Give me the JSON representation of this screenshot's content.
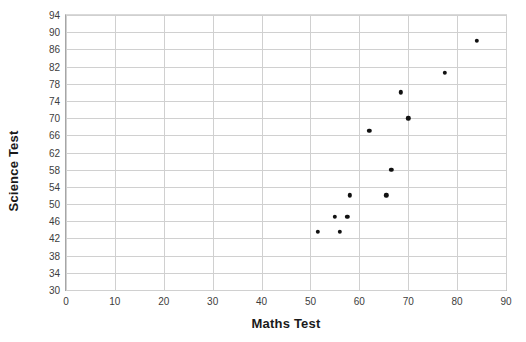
{
  "chart": {
    "title": "",
    "xlabel": "Maths Test",
    "ylabel": "Science Test"
  },
  "chart_data": {
    "type": "scatter",
    "title": "",
    "xlabel": "Maths Test",
    "ylabel": "Science Test",
    "xlim": [
      0,
      90
    ],
    "ylim": [
      30,
      94
    ],
    "xticks": [
      0,
      10,
      20,
      30,
      40,
      50,
      60,
      70,
      80,
      90
    ],
    "yticks": [
      30,
      34,
      38,
      42,
      46,
      50,
      54,
      58,
      62,
      66,
      70,
      74,
      78,
      82,
      86,
      90,
      94
    ],
    "grid": true,
    "legend": false,
    "marker": "filled-circle",
    "marker_color": "#111111",
    "series": [
      {
        "name": "Students",
        "points": [
          [
            51.5,
            43.5
          ],
          [
            56.0,
            43.5
          ],
          [
            55.0,
            47.0
          ],
          [
            57.5,
            47.0
          ],
          [
            58.0,
            52.0
          ],
          [
            65.5,
            52.0
          ],
          [
            66.5,
            58.0
          ],
          [
            62.0,
            67.0
          ],
          [
            70.0,
            70.0
          ],
          [
            68.5,
            76.0
          ],
          [
            77.5,
            80.5
          ],
          [
            84.0,
            88.0
          ]
        ]
      }
    ]
  },
  "colors": {
    "gridline": "#d0d0d0",
    "axis": "#a6a6a6",
    "marker": "#111111",
    "text": "#1a1a1a"
  }
}
